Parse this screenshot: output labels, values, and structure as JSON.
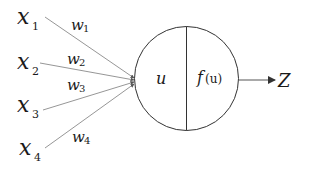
{
  "diagram": {
    "type": "perceptron",
    "inputs": [
      {
        "label": "x",
        "subscript": "1",
        "weight": "w",
        "weight_subscript": "1"
      },
      {
        "label": "x",
        "subscript": "2",
        "weight": "w",
        "weight_subscript": "2"
      },
      {
        "label": "x",
        "subscript": "3",
        "weight": "w",
        "weight_subscript": "3"
      },
      {
        "label": "x",
        "subscript": "4",
        "weight": "w",
        "weight_subscript": "4"
      }
    ],
    "neuron": {
      "left_label": "u",
      "right_label_fn": "f",
      "right_label_arg": "(u)"
    },
    "output": {
      "label": "Z"
    },
    "colors": {
      "line": "#888888",
      "stroke": "#333333",
      "text": "#1a1a1a"
    }
  }
}
